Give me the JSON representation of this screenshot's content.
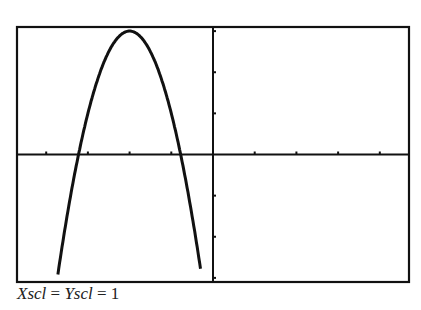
{
  "chart_data": {
    "type": "line",
    "title": "",
    "xlabel": "",
    "ylabel": "",
    "xlim": [
      -4.7,
      4.7
    ],
    "ylim": [
      -3.1,
      3.1
    ],
    "xscl": 1,
    "yscl": 1,
    "grid": false,
    "legend": null,
    "series": [
      {
        "name": "parabola",
        "equation": "y = -2(x+2)^2 + 3",
        "x": [
          -3.72,
          -3.5,
          -3.2,
          -3.0,
          -2.5,
          -2.0,
          -1.5,
          -1.0,
          -0.8,
          -0.5,
          -0.28
        ],
        "y": [
          -2.92,
          -1.5,
          0.12,
          1.0,
          2.5,
          3.0,
          2.5,
          1.0,
          0.12,
          -1.5,
          -2.92
        ]
      }
    ],
    "annotations": [
      "Xscl = Yscl = 1"
    ]
  },
  "caption": {
    "xscl": "Xscl",
    "eq1": " = ",
    "yscl": "Yscl",
    "eq2": " = 1"
  },
  "colors": {
    "axis": "#111111",
    "curve": "#111111",
    "background": "#ffffff"
  }
}
